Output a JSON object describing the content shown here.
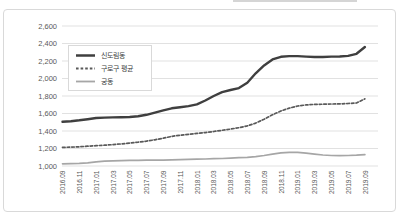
{
  "chart_data": {
    "type": "line",
    "title": "",
    "xlabel": "",
    "ylabel": "",
    "grid": "horizontal",
    "legend_position": "upper-left",
    "ylim": [
      1000,
      2600
    ],
    "ytick_step": 200,
    "ytick_labels": [
      "1,000",
      "1,200",
      "1,400",
      "1,600",
      "1,800",
      "2,000",
      "2,200",
      "2,400",
      "2,600"
    ],
    "x": [
      "2016.09",
      "2016.10",
      "2016.11",
      "2016.12",
      "2017.01",
      "2017.02",
      "2017.03",
      "2017.04",
      "2017.05",
      "2017.06",
      "2017.07",
      "2017.08",
      "2017.09",
      "2017.10",
      "2017.11",
      "2017.12",
      "2018.01",
      "2018.02",
      "2018.03",
      "2018.04",
      "2018.05",
      "2018.06",
      "2018.07",
      "2018.08",
      "2018.09",
      "2018.10",
      "2018.11",
      "2018.12",
      "2019.01",
      "2019.02",
      "2019.03",
      "2019.04",
      "2019.05",
      "2019.06",
      "2019.07",
      "2019.08",
      "2019.09"
    ],
    "tick_every": 2,
    "x_tick_labels": [
      "2016.09",
      "2016.11",
      "2017.01",
      "2017.03",
      "2017.05",
      "2017.07",
      "2017.09",
      "2017.11",
      "2018.01",
      "2018.03",
      "2018.05",
      "2018.07",
      "2018.09",
      "2018.11",
      "2019.01",
      "2019.03",
      "2019.05",
      "2019.07",
      "2019.09"
    ],
    "series": [
      {
        "name": "신도림동",
        "color": "#3f3f3f",
        "style": "solid",
        "width": 2.4,
        "values": [
          1505,
          1512,
          1522,
          1535,
          1548,
          1553,
          1555,
          1558,
          1560,
          1568,
          1585,
          1610,
          1635,
          1660,
          1672,
          1685,
          1705,
          1748,
          1800,
          1845,
          1868,
          1890,
          1952,
          2060,
          2150,
          2218,
          2248,
          2256,
          2256,
          2250,
          2246,
          2246,
          2250,
          2252,
          2258,
          2282,
          2360
        ]
      },
      {
        "name": "구로구 평균",
        "color": "#595959",
        "style": "dashed",
        "width": 1.7,
        "values": [
          1212,
          1216,
          1220,
          1226,
          1232,
          1238,
          1245,
          1252,
          1262,
          1272,
          1285,
          1300,
          1318,
          1338,
          1352,
          1362,
          1372,
          1382,
          1394,
          1408,
          1422,
          1438,
          1458,
          1490,
          1535,
          1585,
          1628,
          1662,
          1686,
          1698,
          1704,
          1706,
          1708,
          1710,
          1714,
          1720,
          1768
        ]
      },
      {
        "name": "궁동",
        "color": "#a6a6a6",
        "style": "solid",
        "width": 1.7,
        "values": [
          1025,
          1027,
          1030,
          1036,
          1048,
          1056,
          1060,
          1062,
          1064,
          1065,
          1066,
          1067,
          1068,
          1070,
          1072,
          1075,
          1078,
          1080,
          1083,
          1086,
          1090,
          1095,
          1100,
          1108,
          1120,
          1136,
          1150,
          1156,
          1156,
          1148,
          1136,
          1126,
          1120,
          1118,
          1120,
          1123,
          1130
        ]
      }
    ]
  },
  "colors": {
    "grid": "#d9d9d9",
    "axis_text": "#595959",
    "frame_border": "#d9d9d9",
    "background": "#ffffff"
  }
}
